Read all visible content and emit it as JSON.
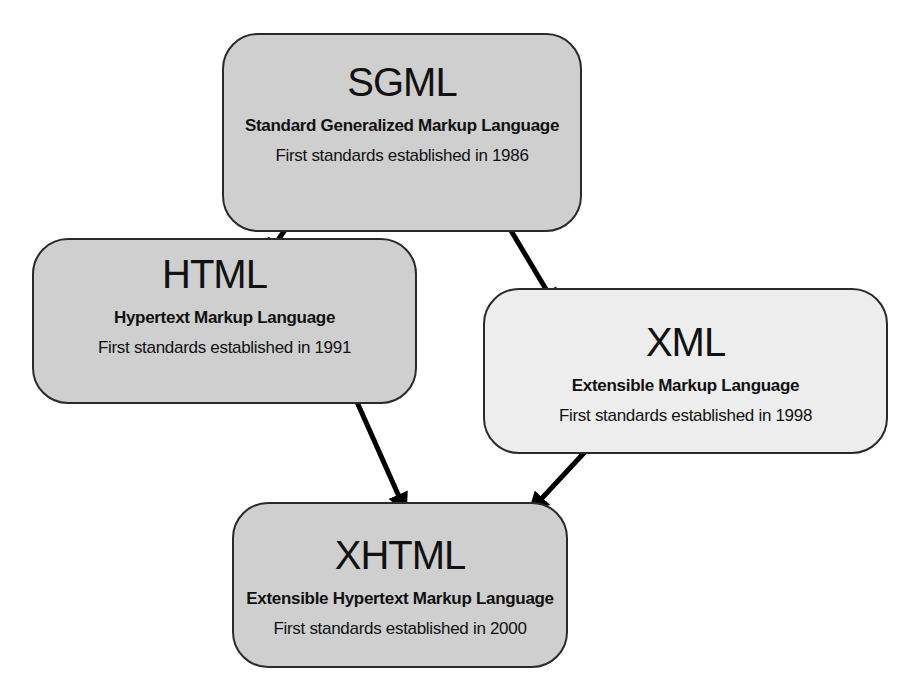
{
  "diagram": {
    "type": "hierarchy",
    "nodes": [
      {
        "id": "sgml",
        "abbr": "SGML",
        "full_name": "Standard Generalized Markup Language",
        "established": "First standards established in 1986",
        "fill": "#cfcfcf"
      },
      {
        "id": "html",
        "abbr": "HTML",
        "full_name": "Hypertext Markup Language",
        "established": "First standards established in 1991",
        "fill": "#cfcfcf"
      },
      {
        "id": "xml",
        "abbr": "XML",
        "full_name": "Extensible Markup Language",
        "established": "First standards established in 1998",
        "fill": "#ededed"
      },
      {
        "id": "xhtml",
        "abbr": "XHTML",
        "full_name": "Extensible Hypertext Markup Language",
        "established": "First standards established in 2000",
        "fill": "#cfcfcf"
      }
    ],
    "edges": [
      {
        "from": "sgml",
        "to": "html"
      },
      {
        "from": "sgml",
        "to": "xml"
      },
      {
        "from": "html",
        "to": "xhtml"
      },
      {
        "from": "xml",
        "to": "xhtml"
      }
    ],
    "colors": {
      "border": "#2a2a2a",
      "arrow": "#000000",
      "text": "#111111",
      "background": "#ffffff"
    }
  }
}
